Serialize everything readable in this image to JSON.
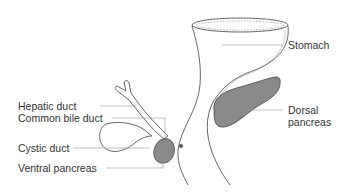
{
  "labels": {
    "stomach": "Stomach",
    "dorsal_pancreas_line1": "Dorsal",
    "dorsal_pancreas_line2": "pancreas",
    "hepatic_duct": "Hepatic duct",
    "common_bile_duct": "Common bile duct",
    "cystic_duct": "Cystic duct",
    "ventral_pancreas": "Ventral pancreas"
  },
  "colors": {
    "outline": "#444444",
    "pancreas_fill": "#8a8a8a",
    "leader_line": "#999999",
    "text": "#333333"
  }
}
